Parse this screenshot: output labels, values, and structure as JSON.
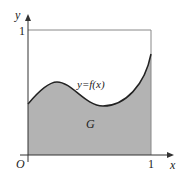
{
  "diagram": {
    "axes": {
      "x_label": "x",
      "y_label": "y",
      "origin_label": "O",
      "x_tick": "1",
      "y_tick": "1"
    },
    "curve_label": "y=f(x)",
    "region_label": "G",
    "colors": {
      "fill": "#b3b3b3",
      "stroke": "#222222",
      "box": "#888888"
    }
  }
}
